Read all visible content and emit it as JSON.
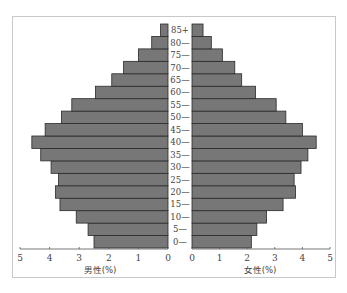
{
  "chart_data": {
    "type": "bar",
    "subtype": "population-pyramid",
    "title": "",
    "categories": [
      "0",
      "5",
      "10",
      "15",
      "20",
      "25",
      "30",
      "35",
      "40",
      "45",
      "50",
      "55",
      "60",
      "65",
      "70",
      "75",
      "80",
      "85+"
    ],
    "category_labels": [
      "0—",
      "5—",
      "10—",
      "15—",
      "20—",
      "25—",
      "30—",
      "35—",
      "40—",
      "45—",
      "50—",
      "55—",
      "60—",
      "65—",
      "70—",
      "75—",
      "80—",
      "85+"
    ],
    "series": [
      {
        "name": "男性(%)",
        "side": "left",
        "values": [
          2.5,
          2.7,
          3.1,
          3.65,
          3.8,
          3.7,
          3.95,
          4.3,
          4.6,
          4.15,
          3.6,
          3.25,
          2.45,
          1.9,
          1.5,
          1.0,
          0.55,
          0.25
        ]
      },
      {
        "name": "女性(%)",
        "side": "right",
        "values": [
          2.15,
          2.35,
          2.7,
          3.3,
          3.75,
          3.7,
          3.95,
          4.2,
          4.5,
          4.0,
          3.4,
          3.05,
          2.3,
          1.8,
          1.55,
          1.1,
          0.7,
          0.4
        ]
      }
    ],
    "xlabel_left": "男性(%)",
    "xlabel_right": "女性(%)",
    "ylabel": "",
    "x_ticks_left": [
      "5",
      "4",
      "3",
      "2",
      "1",
      "0"
    ],
    "x_ticks_right": [
      "0",
      "1",
      "2",
      "3",
      "4",
      "5"
    ],
    "xlim": [
      0,
      5
    ],
    "grid": false,
    "legend": "none",
    "bar_color": "#777777",
    "border_color": "#2a2a2a"
  }
}
